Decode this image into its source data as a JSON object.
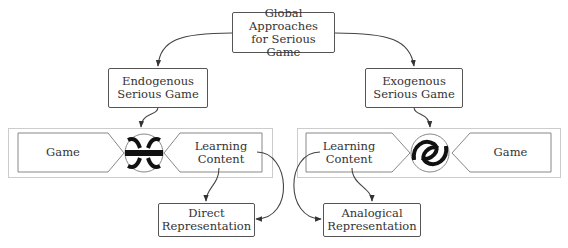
{
  "diagram": {
    "root": {
      "line1": "Global Approaches",
      "line2": "for Serious Game"
    },
    "branches": [
      {
        "line1": "Endogenous",
        "line2": "Serious Game"
      },
      {
        "line1": "Exogenous",
        "line2": "Serious Game"
      }
    ],
    "left_group": {
      "game_label": "Game",
      "content_line1": "Learning",
      "content_line2": "Content",
      "connector_icon": "interlocked-tight-icon"
    },
    "right_group": {
      "game_label": "Game",
      "content_line1": "Learning",
      "content_line2": "Content",
      "connector_icon": "interlocked-loose-icon"
    },
    "outcomes": [
      {
        "line1": "Direct",
        "line2": "Representation"
      },
      {
        "line1": "Analogical",
        "line2": "Representation"
      }
    ],
    "colors": {
      "line": "#444444",
      "box_border": "#555555",
      "container_border": "#cccccc"
    }
  }
}
